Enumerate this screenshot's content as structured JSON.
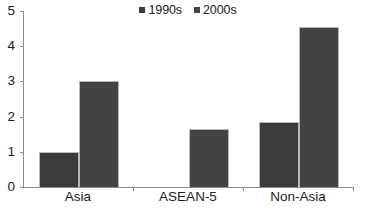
{
  "chart_data": {
    "type": "bar",
    "title": "",
    "xlabel": "",
    "ylabel": "",
    "categories": [
      "Asia",
      "ASEAN-5",
      "Non-Asia"
    ],
    "series": [
      {
        "name": "1990s",
        "color": "#3b3b3b",
        "values": [
          1.0,
          0.0,
          1.85
        ]
      },
      {
        "name": "2000s",
        "color": "#434343",
        "values": [
          3.0,
          1.65,
          4.55
        ]
      }
    ],
    "ylim": [
      0,
      5
    ],
    "yticks": [
      0,
      1,
      2,
      3,
      4,
      5
    ],
    "ytick_labels": [
      "0",
      "1",
      "2",
      "3",
      "4",
      "5"
    ],
    "grid": false,
    "legend": {
      "position": "top-center",
      "entries": [
        "1990s",
        "2000s"
      ]
    }
  }
}
